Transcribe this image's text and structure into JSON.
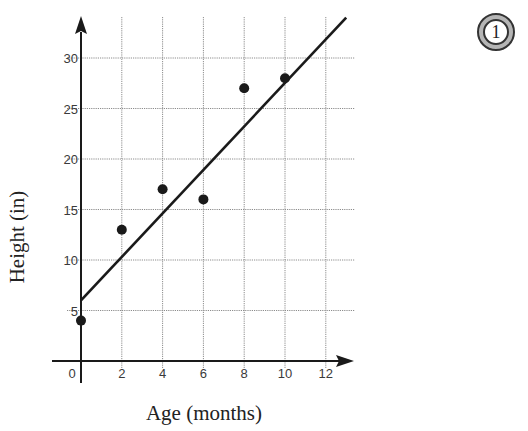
{
  "badge": {
    "label": "1"
  },
  "chart_data": {
    "type": "scatter",
    "title": "",
    "xlabel": "Age (months)",
    "ylabel": "Height (in)",
    "xlim": [
      0,
      13
    ],
    "ylim": [
      0,
      34
    ],
    "x_ticks": [
      0,
      2,
      4,
      6,
      8,
      10,
      12
    ],
    "y_ticks": [
      5,
      10,
      15,
      20,
      25,
      30
    ],
    "x_tick_labels": [
      "0",
      "2",
      "4",
      "6",
      "8",
      "10",
      "12"
    ],
    "y_tick_labels": [
      "5",
      "10",
      "15",
      "20",
      "25",
      "30"
    ],
    "x_grid": [
      2,
      4,
      6,
      8,
      10,
      12
    ],
    "y_grid": [
      5,
      10,
      15,
      20,
      25,
      30
    ],
    "grid": true,
    "legend": "none",
    "series": [
      {
        "name": "Observations",
        "type": "scatter",
        "points": [
          {
            "x": 0,
            "y": 4
          },
          {
            "x": 2,
            "y": 13
          },
          {
            "x": 4,
            "y": 17
          },
          {
            "x": 6,
            "y": 16
          },
          {
            "x": 8,
            "y": 27
          },
          {
            "x": 10,
            "y": 28
          }
        ]
      },
      {
        "name": "Line of best fit",
        "type": "line",
        "points": [
          {
            "x": 0,
            "y": 6
          },
          {
            "x": 13,
            "y": 34
          }
        ]
      }
    ]
  }
}
